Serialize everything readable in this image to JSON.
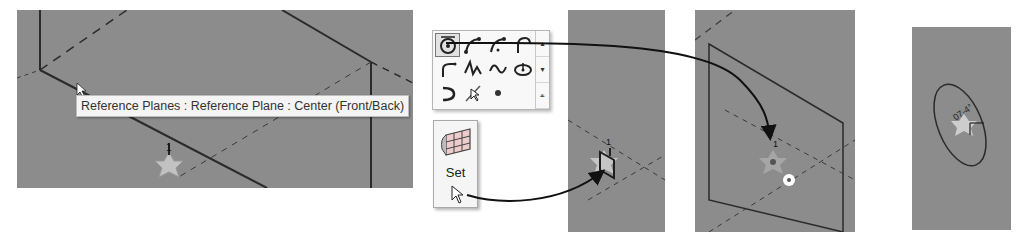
{
  "tooltip": {
    "text": "Reference Planes : Reference Plane : Center (Front/Back)"
  },
  "gallery": {
    "tools": [
      {
        "icon": "arc-center-ends-icon",
        "selected": true
      },
      {
        "icon": "arc-start-end-radius-icon",
        "selected": false
      },
      {
        "icon": "arc-three-point-icon",
        "selected": false
      },
      {
        "icon": "arc-tangent-icon",
        "selected": false
      },
      {
        "icon": "fillet-arc-icon",
        "selected": false
      },
      {
        "icon": "spline-icon",
        "selected": false
      },
      {
        "icon": "spline-through-points-icon",
        "selected": false
      },
      {
        "icon": "ellipse-icon",
        "selected": false
      },
      {
        "icon": "partial-ellipse-icon",
        "selected": false
      },
      {
        "icon": "pick-lines-icon",
        "selected": false
      },
      {
        "icon": "point-element-icon",
        "selected": false
      }
    ],
    "scroll_up": "▴",
    "scroll_down": "▾",
    "expand": "⩡"
  },
  "set_button": {
    "label": "Set"
  },
  "workplane_label_panel1": "1",
  "workplane_label_panel2": "1",
  "workplane_label_panel3": "1",
  "angle_label_panel4": "07-4°",
  "colors": {
    "canvas": "#8c8c8c",
    "line": "#2a2a2a",
    "tooltip_bg": "#f4f4f4",
    "ribbon_bg": "#f8f8f8"
  }
}
